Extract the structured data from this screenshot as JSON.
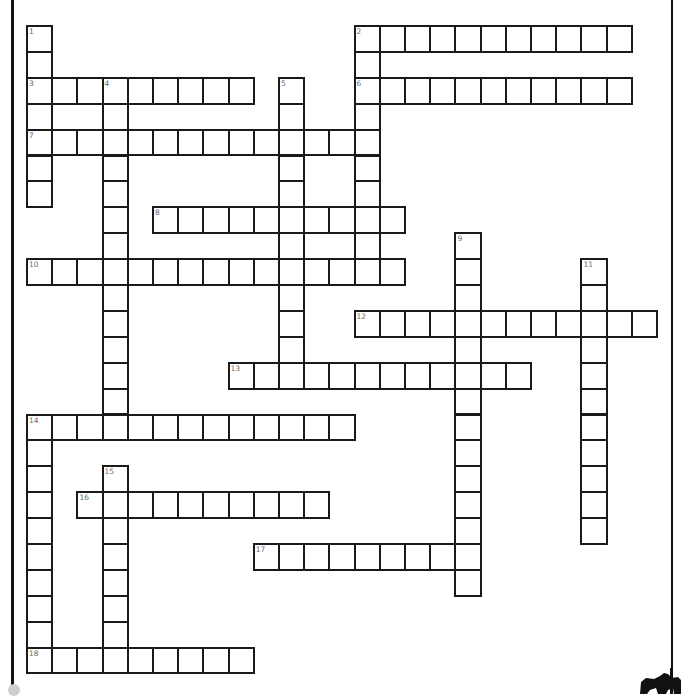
{
  "puzzle": {
    "type": "crossword",
    "grid": {
      "columns": 25,
      "rows": 25
    },
    "words": [
      {
        "number": 1,
        "direction": "down",
        "row": 0,
        "col": 0,
        "length": 7
      },
      {
        "number": 2,
        "direction": "across",
        "row": 0,
        "col": 13,
        "length": 11
      },
      {
        "number": 2,
        "direction": "down",
        "row": 0,
        "col": 13,
        "length": 10
      },
      {
        "number": 3,
        "direction": "across",
        "row": 2,
        "col": 0,
        "length": 9
      },
      {
        "number": 4,
        "direction": "down",
        "row": 2,
        "col": 3,
        "length": 14
      },
      {
        "number": 5,
        "direction": "down",
        "row": 2,
        "col": 10,
        "length": 12
      },
      {
        "number": 6,
        "direction": "across",
        "row": 2,
        "col": 13,
        "length": 11
      },
      {
        "number": 7,
        "direction": "across",
        "row": 4,
        "col": 0,
        "length": 14
      },
      {
        "number": 8,
        "direction": "across",
        "row": 7,
        "col": 5,
        "length": 10
      },
      {
        "number": 9,
        "direction": "down",
        "row": 8,
        "col": 17,
        "length": 14
      },
      {
        "number": 10,
        "direction": "across",
        "row": 9,
        "col": 0,
        "length": 15
      },
      {
        "number": 11,
        "direction": "down",
        "row": 9,
        "col": 22,
        "length": 11
      },
      {
        "number": 12,
        "direction": "across",
        "row": 11,
        "col": 13,
        "length": 12
      },
      {
        "number": 13,
        "direction": "across",
        "row": 13,
        "col": 8,
        "length": 12
      },
      {
        "number": 14,
        "direction": "across",
        "row": 15,
        "col": 0,
        "length": 13
      },
      {
        "number": 14,
        "direction": "down",
        "row": 15,
        "col": 0,
        "length": 10
      },
      {
        "number": 15,
        "direction": "down",
        "row": 17,
        "col": 3,
        "length": 8
      },
      {
        "number": 16,
        "direction": "across",
        "row": 18,
        "col": 2,
        "length": 10
      },
      {
        "number": 17,
        "direction": "across",
        "row": 20,
        "col": 9,
        "length": 9
      },
      {
        "number": 18,
        "direction": "across",
        "row": 24,
        "col": 0,
        "length": 9
      }
    ],
    "numbers": [
      "1",
      "2",
      "3",
      "4",
      "5",
      "6",
      "7",
      "8",
      "9",
      "10",
      "11",
      "12",
      "13",
      "14",
      "15",
      "16",
      "17",
      "18"
    ]
  },
  "layout": {
    "origin_x": 27,
    "origin_y": 26,
    "cell_w": 25.2,
    "cell_h": 25.9
  }
}
